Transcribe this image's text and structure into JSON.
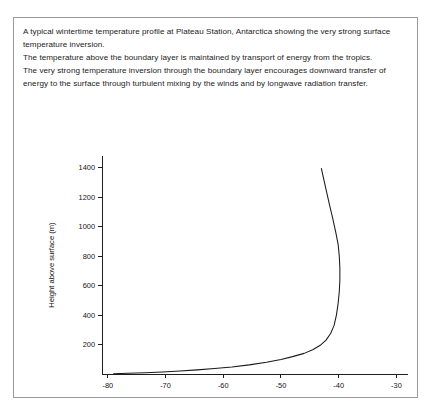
{
  "panel": {
    "caption_lines": [
      "A typical wintertime temperature profile at Plateau Station, Antarctica showing the very strong surface temperature inversion.",
      "The temperature above the boundary layer is maintained by transport of energy from the tropics.",
      "The very strong temperature inversion through the boundary layer encourages downward transfer of energy to the surface through turbulent mixing by the winds and by longwave radiation transfer."
    ]
  },
  "chart_data": {
    "type": "line",
    "title": "",
    "xlabel": "Temperature (°C)",
    "ylabel": "Height above surface (m)",
    "xlim": [
      -81,
      -28
    ],
    "ylim": [
      0,
      1480
    ],
    "xticks": [
      -80,
      -70,
      -60,
      -50,
      -40,
      -30
    ],
    "xticklabels": [
      "-80",
      "-70",
      "-60",
      "-50",
      "-40",
      "-30"
    ],
    "yticks": [
      200,
      400,
      600,
      800,
      1000,
      1200,
      1400
    ],
    "yticklabels": [
      "200",
      "400",
      "600",
      "800",
      "1000",
      "1200",
      "1400"
    ],
    "grid": false,
    "legend": null,
    "series": [
      {
        "name": "Temperature profile",
        "x": [
          -79.0,
          -76.5,
          -73.5,
          -70.5,
          -67.5,
          -64.5,
          -61.5,
          -58.5,
          -55.5,
          -52.5,
          -50.0,
          -48.0,
          -46.0,
          -44.5,
          -43.2,
          -42.2,
          -41.4,
          -40.8,
          -40.4,
          -40.1,
          -39.9,
          -39.8,
          -39.8,
          -39.9,
          -40.1,
          -40.5,
          -41.0,
          -41.6,
          -42.3,
          -43.0
        ],
        "y": [
          2,
          5,
          9,
          14,
          20,
          28,
          37,
          48,
          62,
          80,
          98,
          118,
          140,
          165,
          195,
          230,
          275,
          330,
          400,
          480,
          560,
          640,
          720,
          800,
          880,
          960,
          1050,
          1150,
          1270,
          1395
        ]
      }
    ]
  }
}
